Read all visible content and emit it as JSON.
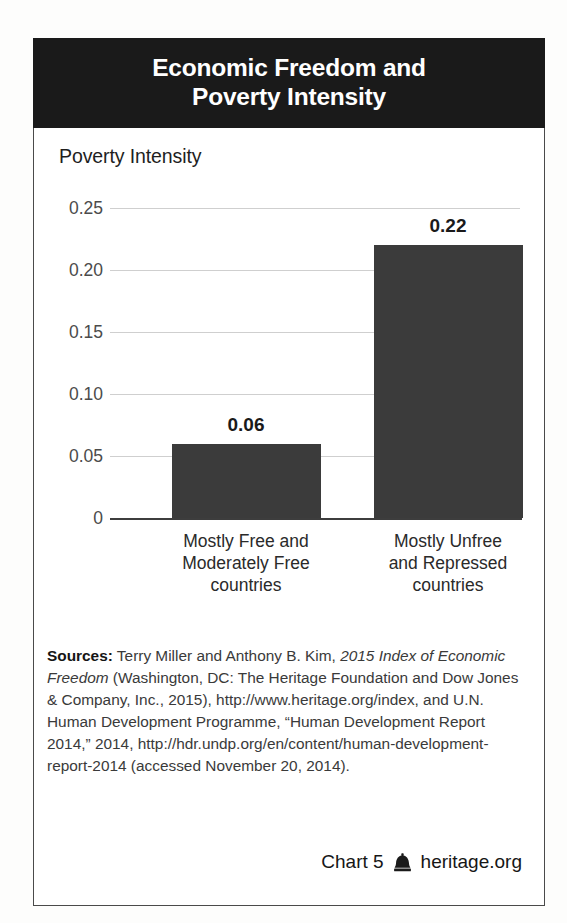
{
  "card": {
    "title_line1": "Economic Freedom and",
    "title_line2": "Poverty Intensity"
  },
  "chart_data": {
    "type": "bar",
    "title": "Economic Freedom and Poverty Intensity",
    "ylabel": "Poverty Intensity",
    "xlabel": "",
    "categories": [
      "Mostly Free and Moderately Free countries",
      "Mostly Unfree and Repressed countries"
    ],
    "category_lines": [
      [
        "Mostly Free and",
        "Moderately Free",
        "countries"
      ],
      [
        "Mostly Unfree",
        "and Repressed",
        "countries"
      ]
    ],
    "values": [
      0.06,
      0.22
    ],
    "value_labels": [
      "0.06",
      "0.22"
    ],
    "ylim": [
      0,
      0.25
    ],
    "yticks": [
      0,
      0.05,
      0.1,
      0.15,
      0.2,
      0.25
    ],
    "ytick_labels": [
      "0",
      "0.05",
      "0.10",
      "0.15",
      "0.20",
      "0.25"
    ],
    "grid": true,
    "legend": false,
    "bar_color": "#3b3b3b",
    "gridline_color": "#cfcfcf"
  },
  "sources": {
    "label": "Sources:",
    "text_1": " Terry Miller and Anthony B. Kim, ",
    "italic_1": "2015 Index of Economic Freedom",
    "text_2": " (Washington, DC: The Heritage Foundation and Dow Jones & Company, Inc., 2015), http://www.heritage.org/index, and U.N. Human Development Programme, “Human Development Report 2014,” 2014, http://hdr.undp.org/en/content/human-development-report-2014 (accessed November 20, 2014)."
  },
  "footer": {
    "chart_number": "Chart 5",
    "logo_icon": "liberty-bell-icon",
    "site": "heritage.org"
  }
}
